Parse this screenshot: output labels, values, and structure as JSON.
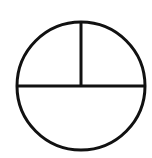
{
  "diagram": {
    "shape": "circle",
    "stroke_color": "#111111",
    "fill_color": "#ffffff",
    "background": "#ffffff",
    "circle": {
      "cx": 81,
      "cy": 86,
      "r": 64,
      "stroke_width": 3
    },
    "dividers": [
      {
        "name": "vertical-divider",
        "x1": 81,
        "y1": 22,
        "x2": 81,
        "y2": 86
      },
      {
        "name": "horizontal-divider",
        "x1": 17,
        "y1": 86,
        "x2": 145,
        "y2": 86
      }
    ],
    "regions": [
      {
        "name": "top-left-quarter",
        "fraction": 0.25
      },
      {
        "name": "top-right-quarter",
        "fraction": 0.25
      },
      {
        "name": "bottom-half",
        "fraction": 0.5
      }
    ]
  }
}
